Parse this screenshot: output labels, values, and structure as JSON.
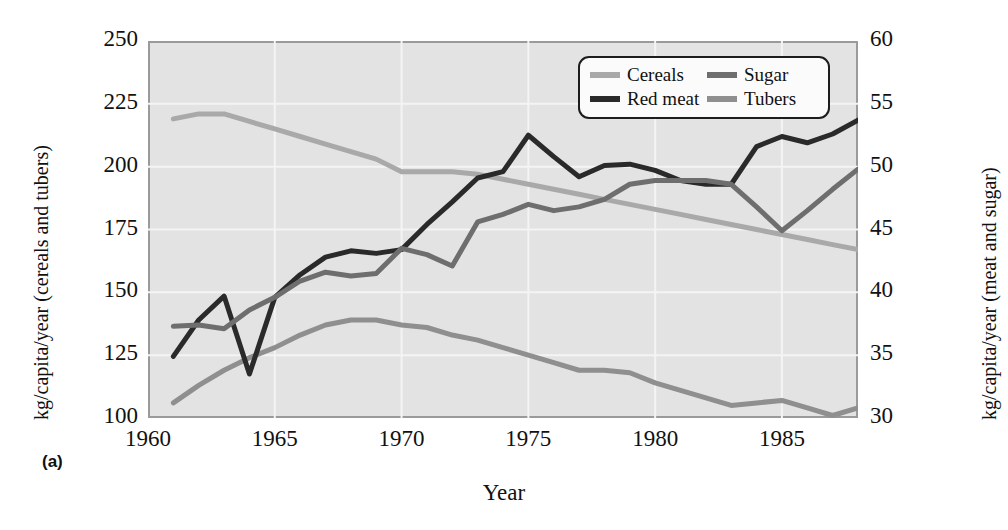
{
  "figure": {
    "panel_tag": "(a)",
    "xlabel": "Year",
    "ylabel_left": "kg/capita/year (cereals and tubers)",
    "ylabel_right": "kg/capita/year (meat and sugar)"
  },
  "legend": {
    "items": [
      {
        "label": "Cereals",
        "color": "#a9a9a9",
        "icon": "legend-swatch"
      },
      {
        "label": "Sugar",
        "color": "#6e6e6e",
        "icon": "legend-swatch"
      },
      {
        "label": "Red meat",
        "color": "#2a2a2a",
        "icon": "legend-swatch"
      },
      {
        "label": "Tubers",
        "color": "#8f8f8f",
        "icon": "legend-swatch"
      }
    ]
  },
  "colors": {
    "plot_background": "#e3e3e3",
    "gridline": "#f4f4f4",
    "frame": "#9a9a9a",
    "cereals": "#a9a9a9",
    "sugar": "#6e6e6e",
    "red_meat": "#2a2a2a",
    "tubers": "#8f8f8f"
  },
  "chart_data": {
    "type": "line",
    "title": "",
    "xlabel": "Year",
    "ylabel": "kg/capita/year (cereals and tubers)",
    "ylabel_secondary": "kg/capita/year (meat and sugar)",
    "grid": true,
    "legend_position": "top-right",
    "xlim": [
      1960,
      1988
    ],
    "xticks": [
      1960,
      1965,
      1970,
      1975,
      1980,
      1985
    ],
    "ylim": [
      100,
      250
    ],
    "yticks": [
      100,
      125,
      150,
      175,
      200,
      225,
      250
    ],
    "ylim_secondary": [
      30,
      60
    ],
    "yticks_secondary": [
      30,
      35,
      40,
      45,
      50,
      55,
      60
    ],
    "x": [
      1961,
      1962,
      1963,
      1964,
      1965,
      1966,
      1967,
      1968,
      1969,
      1970,
      1971,
      1972,
      1973,
      1974,
      1975,
      1976,
      1977,
      1978,
      1979,
      1980,
      1981,
      1982,
      1983,
      1984,
      1985,
      1986,
      1987,
      1988
    ],
    "series": [
      {
        "name": "Cereals",
        "axis": "left",
        "units": "kg/capita/year",
        "color": "#a9a9a9",
        "values": [
          219,
          221,
          221,
          218,
          215,
          212,
          209,
          206,
          203,
          198,
          198,
          198,
          197,
          195,
          193,
          191,
          189,
          187,
          185,
          183,
          181,
          179,
          177,
          175,
          173,
          171,
          169,
          167
        ]
      },
      {
        "name": "Tubers",
        "axis": "left",
        "units": "kg/capita/year",
        "color": "#8f8f8f",
        "values": [
          106,
          113,
          119,
          124,
          128,
          133,
          137,
          139,
          139,
          137,
          136,
          133,
          131,
          128,
          125,
          122,
          119,
          119,
          118,
          114,
          111,
          108,
          105,
          106,
          107,
          104,
          101,
          104
        ]
      },
      {
        "name": "Red meat",
        "axis": "right",
        "units": "kg/capita/year",
        "color": "#2a2a2a",
        "values": [
          34.9,
          37.8,
          39.7,
          33.5,
          39.6,
          41.4,
          42.8,
          43.3,
          43.1,
          43.4,
          45.4,
          47.2,
          49.1,
          49.6,
          52.5,
          50.8,
          49.2,
          50.1,
          50.2,
          49.7,
          48.9,
          48.6,
          48.6,
          51.6,
          52.4,
          51.9,
          52.6,
          53.7
        ]
      },
      {
        "name": "Sugar",
        "axis": "right",
        "units": "kg/capita/year",
        "color": "#6e6e6e",
        "values": [
          37.3,
          37.4,
          37.1,
          38.6,
          39.6,
          40.9,
          41.6,
          41.3,
          41.5,
          43.5,
          43.0,
          42.1,
          45.6,
          46.2,
          47.0,
          46.5,
          46.8,
          47.4,
          48.6,
          48.9,
          48.9,
          48.9,
          48.6,
          46.8,
          44.9,
          46.5,
          48.2,
          49.8
        ]
      }
    ]
  }
}
